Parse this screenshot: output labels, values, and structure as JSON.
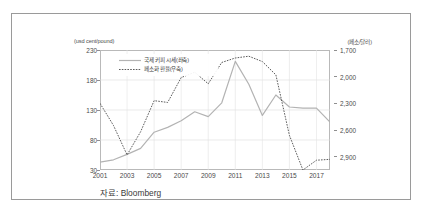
{
  "figure": {
    "left_unit": "(usd cent/pound)",
    "right_unit": "(페소/달러)",
    "source": "자료: Bloomberg"
  },
  "legend": {
    "items": [
      {
        "label": "국제 커피 시세(좌축)",
        "style": "solid",
        "color": "#b3b3b3"
      },
      {
        "label": "페소화 환율(우축)",
        "style": "dotted",
        "color": "#4a4a4a"
      }
    ]
  },
  "chart_data": {
    "type": "line",
    "title": "",
    "xlabel": "",
    "grid": true,
    "legend_position": "top-left",
    "x": [
      2001,
      2002,
      2003,
      2004,
      2005,
      2006,
      2007,
      2008,
      2009,
      2010,
      2011,
      2012,
      2013,
      2014,
      2015,
      2016,
      2017,
      2018
    ],
    "xticks": [
      "2001",
      "2003",
      "2005",
      "2007",
      "2009",
      "2011",
      "2013",
      "2015",
      "2017"
    ],
    "axes": [
      {
        "id": "left",
        "label": "(usd cent/pound)",
        "ylim": [
          30,
          230
        ],
        "yticks": [
          "230",
          "180",
          "130",
          "80",
          "30"
        ],
        "ytick_values": [
          230,
          180,
          130,
          80,
          30
        ],
        "inverted": false
      },
      {
        "id": "right",
        "label": "(페소/달러)",
        "ylim": [
          1700,
          3050
        ],
        "yticks": [
          "1,700",
          "2,000",
          "2,300",
          "2,600",
          "2,900"
        ],
        "ytick_values": [
          1700,
          2000,
          2300,
          2600,
          2900
        ],
        "inverted": true
      }
    ],
    "series": [
      {
        "name": "국제 커피 시세(좌축)",
        "axis": "left",
        "style": "solid",
        "color": "#b3b3b3",
        "unit": "usd cent/pound",
        "values": [
          43,
          47,
          56,
          66,
          93,
          101,
          112,
          127,
          119,
          142,
          211,
          173,
          121,
          155,
          135,
          133,
          133,
          110
        ]
      },
      {
        "name": "페소화 환율(우축)",
        "axis": "right",
        "style": "dotted",
        "color": "#4a4a4a",
        "unit": "페소/달러",
        "values": [
          2300,
          2550,
          2880,
          2620,
          2270,
          2290,
          2010,
          1950,
          2080,
          1840,
          1790,
          1770,
          1830,
          1980,
          2660,
          3050,
          2940,
          2930
        ]
      }
    ]
  }
}
